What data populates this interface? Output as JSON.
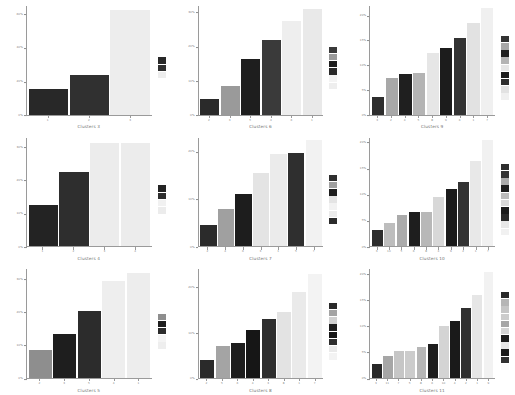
{
  "figure": {
    "type": "small-multiples-bar-grid",
    "rows": 3,
    "columns": 3,
    "background": "#ffffff",
    "axis_color": "#9a9a9a",
    "tick_label_color": "#808080",
    "title_color": "#6f6f6f"
  },
  "chart_data": [
    {
      "type": "bar",
      "title": "Clusters 3",
      "xlabel": "Clusters 3",
      "ylabel": "",
      "grid": false,
      "legend_position": "right",
      "ylim": [
        0,
        65
      ],
      "yticks": [
        "0%",
        "20%",
        "40%",
        "60%"
      ],
      "ytick_values": [
        0,
        20,
        40,
        60
      ],
      "categories": [
        "1",
        "2",
        "3"
      ],
      "values": [
        15.5,
        23.5,
        62.5
      ],
      "colors": [
        "#282828",
        "#303030",
        "#ededed"
      ],
      "legend": [
        "#282828",
        "#303030",
        "#ededed"
      ]
    },
    {
      "type": "bar",
      "title": "Clusters 6",
      "xlabel": "Clusters 6",
      "ylabel": "",
      "grid": false,
      "legend_position": "right",
      "ylim": [
        0,
        32
      ],
      "yticks": [
        "0%",
        "10%",
        "20%",
        "30%"
      ],
      "ytick_values": [
        0,
        10,
        20,
        30
      ],
      "categories": [
        "2",
        "3",
        "5",
        "4",
        "6",
        "1"
      ],
      "values": [
        4.5,
        8.5,
        16.5,
        22.0,
        27.5,
        31.0
      ],
      "colors": [
        "#2a2a2a",
        "#9a9a9a",
        "#1e1e1e",
        "#3a3a3a",
        "#eeeeee",
        "#e9e9e9"
      ],
      "legend": [
        "#3a3a3a",
        "#9a9a9a",
        "#1e1e1e",
        "#2a2a2a",
        "#f4f4f4",
        "#eeeeee"
      ]
    },
    {
      "type": "bar",
      "title": "Clusters 9",
      "xlabel": "Clusters 9",
      "ylabel": "",
      "grid": false,
      "legend_position": "right",
      "ylim": [
        0,
        22
      ],
      "yticks": [
        "0%",
        "5%",
        "10%",
        "15%",
        "20%"
      ],
      "ytick_values": [
        0,
        5,
        10,
        15,
        20
      ],
      "categories": [
        "3",
        "2",
        "4",
        "5",
        "8",
        "9",
        "6",
        "1",
        "7"
      ],
      "values": [
        3.5,
        7.5,
        8.3,
        8.4,
        12.5,
        13.5,
        15.5,
        18.5,
        21.5
      ],
      "colors": [
        "#2e2e2e",
        "#a8a8a8",
        "#1f1f1f",
        "#b4b4b4",
        "#e6e6e6",
        "#1c1c1c",
        "#333333",
        "#e2e2e2",
        "#f0f0f0"
      ],
      "legend": [
        "#333333",
        "#a8a8a8",
        "#1f1f1f",
        "#b4b4b4",
        "#e6e6e6",
        "#1c1c1c",
        "#2e2e2e",
        "#e2e2e2",
        "#f0f0f0"
      ]
    },
    {
      "type": "bar",
      "title": "Clusters 4",
      "xlabel": "Clusters 4",
      "ylabel": "",
      "grid": false,
      "legend_position": "right",
      "ylim": [
        0,
        33
      ],
      "yticks": [
        "0%",
        "10%",
        "20%",
        "30%"
      ],
      "ytick_values": [
        0,
        10,
        20,
        30
      ],
      "categories": [
        "1",
        "2",
        "3",
        "4"
      ],
      "values": [
        12.5,
        22.5,
        31.5,
        31.5
      ],
      "colors": [
        "#232323",
        "#2e2e2e",
        "#ececec",
        "#ececec"
      ],
      "legend": [
        "#232323",
        "#2e2e2e",
        "#f1f1f1",
        "#ececec"
      ]
    },
    {
      "type": "bar",
      "title": "Clusters 7",
      "xlabel": "Clusters 7",
      "ylabel": "",
      "grid": false,
      "legend_position": "right",
      "ylim": [
        0,
        23
      ],
      "yticks": [
        "0%",
        "10%",
        "20%"
      ],
      "ytick_values": [
        0,
        10,
        20
      ],
      "categories": [
        "2",
        "4",
        "6",
        "3",
        "1",
        "5",
        "7"
      ],
      "values": [
        4.5,
        8.0,
        11.0,
        15.5,
        19.5,
        19.8,
        22.5
      ],
      "colors": [
        "#2b2b2b",
        "#a0a0a0",
        "#1d1d1d",
        "#e4e4e4",
        "#ebebeb",
        "#2f2f2f",
        "#f2f2f2"
      ],
      "legend": [
        "#2f2f2f",
        "#a0a0a0",
        "#1d1d1d",
        "#e4e4e4",
        "#f2f2f2",
        "#ebebeb",
        "#2b2b2b"
      ]
    },
    {
      "type": "bar",
      "title": "Clusters 10",
      "xlabel": "Clusters 10",
      "ylabel": "",
      "grid": false,
      "legend_position": "right",
      "ylim": [
        0,
        21
      ],
      "yticks": [
        "0%",
        "5%",
        "10%",
        "15%",
        "20%"
      ],
      "ytick_values": [
        0,
        5,
        10,
        15,
        20
      ],
      "categories": [
        "3",
        "10",
        "5",
        "6",
        "8",
        "4",
        "9",
        "2",
        "1",
        "7"
      ],
      "values": [
        3.2,
        4.6,
        6.0,
        6.6,
        6.6,
        9.5,
        11.0,
        12.5,
        16.5,
        20.5
      ],
      "colors": [
        "#2d2d2d",
        "#bdbdbd",
        "#ababab",
        "#1e1e1e",
        "#b8b8b8",
        "#d8d8d8",
        "#1b1b1b",
        "#333333",
        "#e8e8e8",
        "#f1f1f1"
      ],
      "legend": [
        "#2d2d2d",
        "#333333",
        "#ababab",
        "#1e1e1e",
        "#bdbdbd",
        "#d8d8d8",
        "#1b1b1b",
        "#2a2a2a",
        "#e8e8e8",
        "#f1f1f1"
      ]
    },
    {
      "type": "bar",
      "title": "Clusters 5",
      "xlabel": "Clusters 5",
      "ylabel": "",
      "grid": false,
      "legend_position": "right",
      "ylim": [
        0,
        33
      ],
      "yticks": [
        "0%",
        "10%",
        "20%",
        "30%"
      ],
      "ytick_values": [
        0,
        10,
        20,
        30
      ],
      "categories": [
        "2",
        "3",
        "5",
        "4",
        "1"
      ],
      "values": [
        8.5,
        13.5,
        20.5,
        29.5,
        32.0
      ],
      "colors": [
        "#8e8e8e",
        "#1e1e1e",
        "#2c2c2c",
        "#eeeeee",
        "#ededed"
      ],
      "legend": [
        "#8e8e8e",
        "#1e1e1e",
        "#2c2c2c",
        "#f4f4f4",
        "#eeeeee"
      ]
    },
    {
      "type": "bar",
      "title": "Clusters 8",
      "xlabel": "Clusters 8",
      "ylabel": "",
      "grid": false,
      "legend_position": "right",
      "ylim": [
        0,
        24
      ],
      "yticks": [
        "0%",
        "10%",
        "20%"
      ],
      "ytick_values": [
        0,
        10,
        20
      ],
      "categories": [
        "2",
        "5",
        "6",
        "4",
        "3",
        "8",
        "1",
        "7"
      ],
      "values": [
        4.0,
        7.0,
        7.8,
        10.5,
        13.0,
        14.5,
        19.0,
        23.0
      ],
      "colors": [
        "#2a2a2a",
        "#a4a4a4",
        "#1d1d1d",
        "#161616",
        "#2e2e2e",
        "#e3e3e3",
        "#eaeaea",
        "#f3f3f3"
      ],
      "legend": [
        "#2a2a2a",
        "#a4a4a4",
        "#d0d0d0",
        "#1d1d1d",
        "#161616",
        "#2e2e2e",
        "#eaeaea",
        "#f3f3f3"
      ]
    },
    {
      "type": "bar",
      "title": "Clusters 11",
      "xlabel": "Clusters 11",
      "ylabel": "",
      "grid": false,
      "legend_position": "right",
      "ylim": [
        0,
        21
      ],
      "yticks": [
        "0%",
        "5%",
        "10%",
        "15%",
        "20%"
      ],
      "ytick_values": [
        0,
        5,
        10,
        15,
        20
      ],
      "categories": [
        "3",
        "11",
        "7",
        "5",
        "8",
        "6",
        "10",
        "4",
        "2",
        "1",
        "9"
      ],
      "values": [
        2.8,
        4.2,
        5.2,
        5.2,
        6.0,
        6.5,
        10.0,
        11.0,
        13.5,
        16.0,
        20.5
      ],
      "colors": [
        "#282828",
        "#a6a6a6",
        "#c6c6c6",
        "#cccccc",
        "#b6b6b6",
        "#1d1d1d",
        "#d4d4d4",
        "#1a1a1a",
        "#303030",
        "#e6e6e6",
        "#f2f2f2"
      ],
      "legend": [
        "#282828",
        "#b6b6b6",
        "#c6c6c6",
        "#cccccc",
        "#a6a6a6",
        "#d4d4d4",
        "#1d1d1d",
        "#e6e6e6",
        "#1a1a1a",
        "#303030",
        "#fafafa"
      ]
    }
  ]
}
